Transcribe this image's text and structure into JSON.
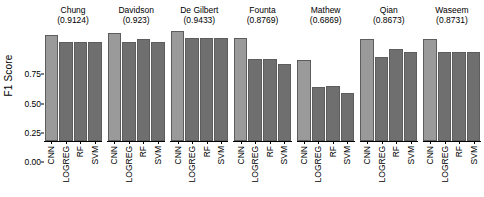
{
  "chart_data": {
    "type": "bar",
    "title": "",
    "xlabel": "",
    "ylabel": "F1 Score",
    "ylim": [
      0,
      1.0
    ],
    "ytick_labels": [
      "0.00",
      "0.25",
      "0.50",
      "0.75"
    ],
    "ytick_values": [
      0.0,
      0.25,
      0.5,
      0.75
    ],
    "grid": false,
    "legend": "none",
    "categories": [
      "CNN",
      "LOGREG",
      "RF",
      "SVM"
    ],
    "panels": [
      {
        "name": "Chung",
        "score": "0.9124",
        "title": "Chung\n(0.9124)",
        "values": [
          0.91,
          0.85,
          0.85,
          0.85
        ]
      },
      {
        "name": "Davidson",
        "score": "0.923",
        "title": "Davidson\n(0.923)",
        "values": [
          0.92,
          0.85,
          0.87,
          0.85
        ]
      },
      {
        "name": "De Gilbert",
        "score": "0.9433",
        "title": "De Gilbert\n(0.9433)",
        "values": [
          0.94,
          0.88,
          0.88,
          0.88
        ]
      },
      {
        "name": "Founta",
        "score": "0.8769",
        "title": "Founta\n(0.8769)",
        "values": [
          0.88,
          0.7,
          0.7,
          0.66
        ]
      },
      {
        "name": "Mathew",
        "score": "0.6869",
        "title": "Mathew\n(0.6869)",
        "values": [
          0.69,
          0.46,
          0.47,
          0.41
        ]
      },
      {
        "name": "Qian",
        "score": "0.8673",
        "title": "Qian\n(0.8673)",
        "values": [
          0.87,
          0.72,
          0.79,
          0.76
        ]
      },
      {
        "name": "Waseem",
        "score": "0.8731",
        "title": "Waseem\n(0.8731)",
        "values": [
          0.87,
          0.76,
          0.76,
          0.76
        ]
      }
    ],
    "colors": {
      "cnn_bar": "#9a9a9a",
      "other_bar": "#6f6f6f",
      "bar_edge": "#5d5d5d",
      "axis": "#000000",
      "background": "#ffffff"
    }
  }
}
